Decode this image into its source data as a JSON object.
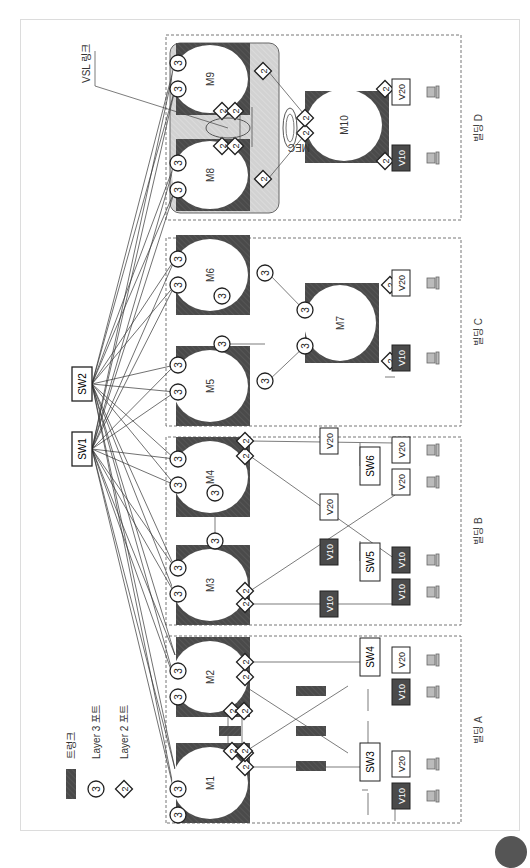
{
  "legend": {
    "trunk_label": "트렁크",
    "l3_label": "Layer 3 포트",
    "l2_label": "Layer 2 포트",
    "l3_glyph": "3",
    "l2_glyph": "2"
  },
  "core_switches": [
    {
      "id": "sw1",
      "label": "SW1"
    },
    {
      "id": "sw2",
      "label": "SW2"
    }
  ],
  "buildings": [
    {
      "id": "a",
      "label": "빌딩 A"
    },
    {
      "id": "b",
      "label": "빌딩 B"
    },
    {
      "id": "c",
      "label": "빌딩 C"
    },
    {
      "id": "d",
      "label": "빌딩 D"
    }
  ],
  "modules": {
    "m1": "M1",
    "m2": "M2",
    "m3": "M3",
    "m4": "M4",
    "m5": "M5",
    "m6": "M6",
    "m7": "M7",
    "m8": "M8",
    "m9": "M9",
    "m10": "M10"
  },
  "access_switches": {
    "sw3": "SW3",
    "sw4": "SW4",
    "sw5": "SW5",
    "sw6": "SW6"
  },
  "vlans": {
    "v10": "V10",
    "v20": "V20"
  },
  "annotations": {
    "vsl_link": "VSL 링크",
    "mec": "MEC"
  },
  "colors": {
    "module_fill": "#4a4a4a",
    "vss_bg": "#d4d4d4",
    "trunk": "#555555",
    "v10_fill": "#4a4a4a",
    "v20_fill": "#ffffff",
    "line": "#444444"
  }
}
